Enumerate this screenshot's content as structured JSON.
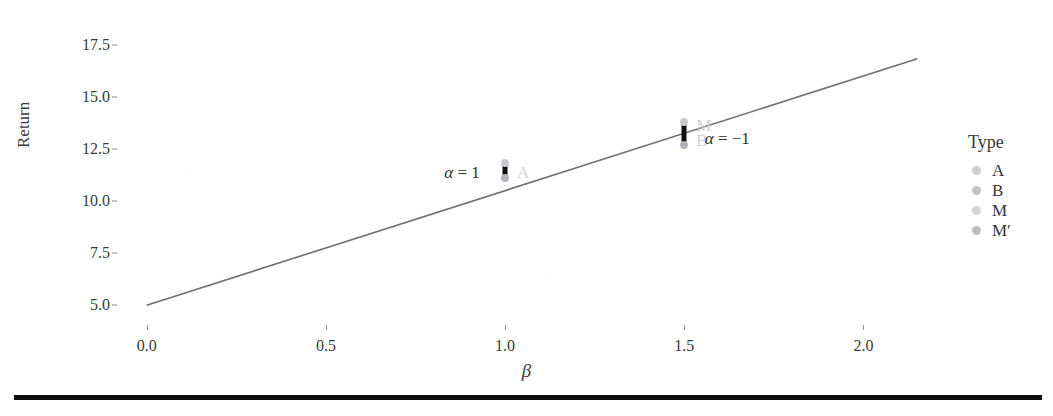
{
  "figure": {
    "artifact_top_text": "",
    "bottom_rule": true
  },
  "chart_data": {
    "type": "scatter",
    "title": "",
    "xlabel": "β",
    "ylabel": "Return",
    "xlim": [
      -0.08,
      2.18
    ],
    "ylim": [
      4.2,
      18.1
    ],
    "xticks": [
      "0.0",
      "0.5",
      "1.0",
      "1.5",
      "2.0"
    ],
    "xtick_values": [
      0.0,
      0.5,
      1.0,
      1.5,
      2.0
    ],
    "yticks": [
      "5.0",
      "7.5",
      "10.0",
      "12.5",
      "15.0",
      "17.5"
    ],
    "ytick_values": [
      5.0,
      7.5,
      10.0,
      12.5,
      15.0,
      17.5
    ],
    "grid": false,
    "legend_position": "right",
    "legend_title": "Type",
    "series": [
      {
        "name": "security-market-line",
        "type": "line",
        "label": "SML",
        "x": [
          0.0,
          2.15
        ],
        "y": [
          5.0,
          16.82
        ],
        "intercept": 5.0,
        "slope": 5.5,
        "color": "#6e6e76"
      },
      {
        "name": "cluster-beta-1",
        "type": "scatter",
        "x": 1.0,
        "y_low": 11.0,
        "y_high": 11.9,
        "point_label": "A",
        "annotation": "α = 1",
        "color": "#101010"
      },
      {
        "name": "cluster-beta-1.5",
        "type": "scatter",
        "x": 1.5,
        "y_low": 12.6,
        "y_high": 13.9,
        "point_label_top": "M",
        "point_label_bottom": "B",
        "annotation": "α = −1",
        "color": "#101010"
      }
    ],
    "legend_entries": [
      {
        "label": "A",
        "color": "#cdcdd3"
      },
      {
        "label": "B",
        "color": "#c2c2c9"
      },
      {
        "label": "M",
        "color": "#d4d4da"
      },
      {
        "label": "M′",
        "color": "#bdbdc5"
      }
    ],
    "annotations": [
      {
        "text": "α = 1",
        "x": 0.88,
        "y": 11.35
      },
      {
        "text": "α = −1",
        "x": 1.62,
        "y": 12.95
      }
    ]
  }
}
